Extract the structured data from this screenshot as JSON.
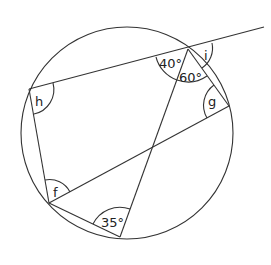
{
  "diagram": {
    "type": "circle-geometry",
    "circle": {
      "cx": 127,
      "cy": 133,
      "r": 106
    },
    "points": {
      "A": {
        "x": 188,
        "y": 49
      },
      "H": {
        "x": 29,
        "y": 89
      },
      "F": {
        "x": 49,
        "y": 203
      },
      "B": {
        "x": 120,
        "y": 237
      },
      "G": {
        "x": 229,
        "y": 106
      },
      "T": {
        "x": 264,
        "y": 27
      },
      "X": {
        "x": 152,
        "y": 147
      }
    },
    "labels": {
      "angle_40": "40°",
      "angle_60": "60°",
      "angle_i": "i",
      "angle_g": "g",
      "angle_h": "h",
      "angle_f": "f",
      "angle_35": "35°"
    }
  }
}
